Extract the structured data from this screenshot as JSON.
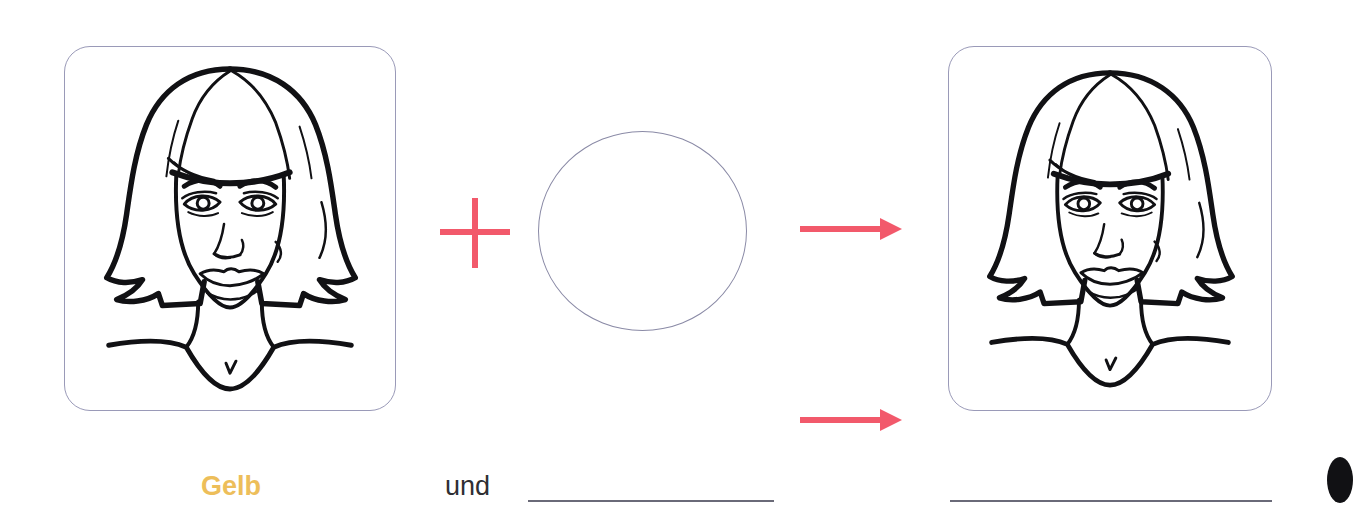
{
  "worksheet": {
    "language": "de",
    "equation": {
      "operator_label": "plus",
      "result_label": "ergibt"
    },
    "panels": [
      {
        "id": "panel-left",
        "name": "face-illustration-before",
        "description": "Strichzeichnung Frauengesicht mit Bob-Frisur",
        "border_color": "#9a9ab8",
        "background_color": "#ffffff"
      },
      {
        "id": "panel-right",
        "name": "face-illustration-after",
        "description": "Strichzeichnung Frauengesicht mit Bob-Frisur",
        "border_color": "#9a9ab8",
        "background_color": "#ffffff"
      }
    ],
    "color_circle": {
      "label": "",
      "fill": "#ffffff",
      "stroke": "#8a8aa6"
    },
    "symbols": {
      "plus": "+",
      "plus_color": "#f2596b",
      "arrow": "→",
      "arrow_color": "#f2596b"
    },
    "caption": {
      "first_color": "Gelb",
      "first_color_hex": "#edbe5a",
      "conjunction": "und",
      "conjunction_color": "#2f2f33",
      "blank_1": "",
      "blank_2": "",
      "blank_line_color": "#6a6a78"
    }
  }
}
